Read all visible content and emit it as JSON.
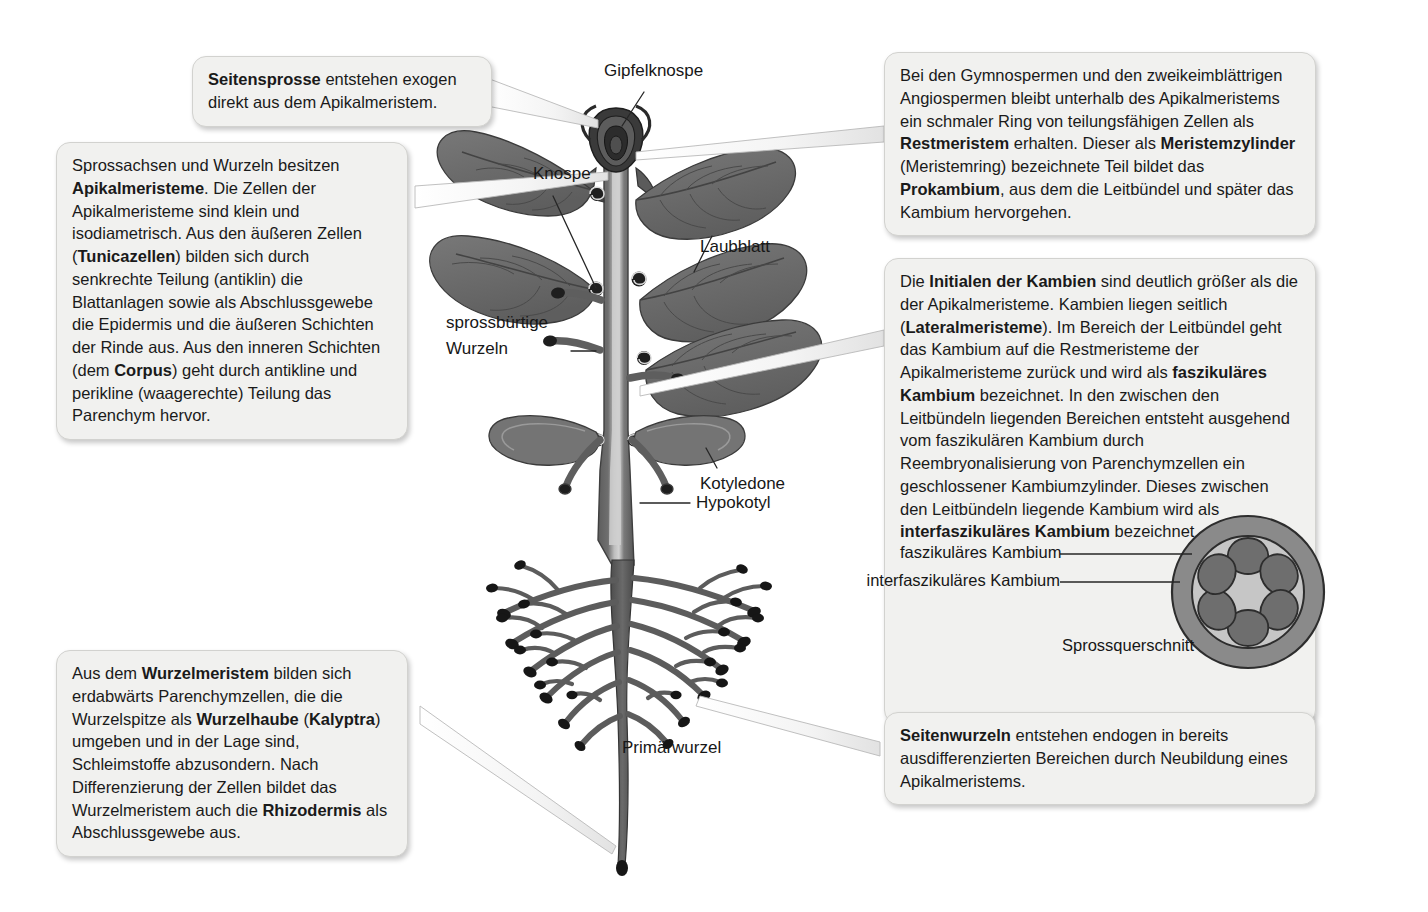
{
  "figure": {
    "background_color": "#ffffff"
  },
  "colors": {
    "callout_bg": "#f1f1ef",
    "callout_border": "#d2d2cf",
    "text": "#1a1a1a",
    "plant_mid_gray": "#6f6f6f",
    "plant_dark_gray": "#3a3a3a",
    "plant_light_gray": "#c9c9c9",
    "xsec_outer_ring": "#8a8a8a",
    "xsec_inner": "#c6c6c6",
    "xsec_bundle": "#6e6e6e",
    "leader_line": "#3a3a3a"
  },
  "callouts": [
    {
      "id": "seitensprosse",
      "name": "callout-seitensprosse",
      "segments": [
        {
          "text": "Seitensprosse",
          "bold": true
        },
        {
          "text": " entstehen exogen direkt aus dem Apikalmeristem.",
          "bold": false
        }
      ]
    },
    {
      "id": "apikalmeristeme",
      "name": "callout-apikalmeristeme",
      "segments": [
        {
          "text": "Sprossachsen und Wurzeln besitzen ",
          "bold": false
        },
        {
          "text": "Apikalmeristeme",
          "bold": true
        },
        {
          "text": ". Die Zellen der Apikalmeristeme sind klein und isodiametrisch. Aus den äußeren Zellen (",
          "bold": false
        },
        {
          "text": "Tunicazellen",
          "bold": true
        },
        {
          "text": ") bilden sich durch senkrechte Teilung (antiklin) die Blattanlagen sowie als Abschlussgewebe die Epidermis und die äußeren Schichten der Rinde aus. Aus den inneren Schichten (dem ",
          "bold": false
        },
        {
          "text": "Corpus",
          "bold": true
        },
        {
          "text": ") geht durch antikline und perikline (waagerechte) Teilung das Parenchym hervor.",
          "bold": false
        }
      ]
    },
    {
      "id": "gymnospermen",
      "name": "callout-gymnospermen-restmeristem",
      "segments": [
        {
          "text": "Bei den Gymnospermen und den zweikeimblättrigen Angiospermen bleibt unterhalb des Apikalmeristems ein schmaler Ring von teilungsfähigen Zellen als ",
          "bold": false
        },
        {
          "text": "Restmeristem",
          "bold": true
        },
        {
          "text": " erhalten. Dieser als ",
          "bold": false
        },
        {
          "text": "Meristemzylinder",
          "bold": true
        },
        {
          "text": " (Meristemring) bezeichnete Teil bildet das ",
          "bold": false
        },
        {
          "text": "Prokambium",
          "bold": true
        },
        {
          "text": ", aus dem die Leitbündel und später das Kambium hervorgehen.",
          "bold": false
        }
      ]
    },
    {
      "id": "kambien",
      "name": "callout-initialen-der-kambien",
      "segments": [
        {
          "text": "Die ",
          "bold": false
        },
        {
          "text": "Initialen der Kambien",
          "bold": true
        },
        {
          "text": " sind deutlich größer als die der Apikalmeristeme. Kambien liegen seitlich (",
          "bold": false
        },
        {
          "text": "Lateralmeristeme",
          "bold": true
        },
        {
          "text": "). Im Bereich der Leitbündel geht das Kambium auf die Restmeristeme der Apikalmeristeme zurück und wird als ",
          "bold": false
        },
        {
          "text": "faszikuläres Kambium",
          "bold": true
        },
        {
          "text": " bezeichnet. In den zwischen den Leitbündeln liegenden Bereichen entsteht ausgehend vom faszikulären Kambium durch Reembryonalisierung von Parenchymzellen ein geschlossener Kambiumzylinder. Dieses zwischen den Leitbündeln liegende Kambium wird als ",
          "bold": false
        },
        {
          "text": "interfaszikuläres Kambium",
          "bold": true
        },
        {
          "text": " bezeichnet.",
          "bold": false
        }
      ]
    },
    {
      "id": "wurzelmeristem",
      "name": "callout-wurzelmeristem",
      "segments": [
        {
          "text": "Aus dem ",
          "bold": false
        },
        {
          "text": "Wurzelmeristem",
          "bold": true
        },
        {
          "text": " bilden sich erdabwärts Parenchymzellen, die die Wurzelspitze als ",
          "bold": false
        },
        {
          "text": "Wurzelhaube",
          "bold": true
        },
        {
          "text": " (",
          "bold": false
        },
        {
          "text": "Kalyptra",
          "bold": true
        },
        {
          "text": ") umgeben und in der Lage sind, Schleimstoffe abzusondern. Nach Differenzierung der Zellen bildet das Wurzelmeristem auch die ",
          "bold": false
        },
        {
          "text": "Rhizodermis",
          "bold": true
        },
        {
          "text": " als Abschlussgewebe aus.",
          "bold": false
        }
      ]
    },
    {
      "id": "seitenwurzeln",
      "name": "callout-seitenwurzeln",
      "segments": [
        {
          "text": "Seitenwurzeln",
          "bold": true
        },
        {
          "text": " entstehen endogen in bereits ausdifferenzierten Bereichen durch Neubildung eines Apikalmeristems.",
          "bold": false
        }
      ]
    }
  ],
  "diagram_labels": [
    {
      "id": "gipfelknospe",
      "name": "label-gipfelknospe",
      "text": "Gipfelknospe"
    },
    {
      "id": "knospe",
      "name": "label-knospe",
      "text": "Knospe"
    },
    {
      "id": "laubblatt",
      "name": "label-laubblatt",
      "text": "Laubblatt"
    },
    {
      "id": "sprossbuertige",
      "name": "label-sprossbuertige-wurzeln-line1",
      "text": "sprossbürtige"
    },
    {
      "id": "wurzeln",
      "name": "label-sprossbuertige-wurzeln-line2",
      "text": "Wurzeln"
    },
    {
      "id": "kotyledone",
      "name": "label-kotyledone",
      "text": "Kotyledone"
    },
    {
      "id": "hypokotyl",
      "name": "label-hypokotyl",
      "text": "Hypokotyl"
    },
    {
      "id": "primaerwurzel",
      "name": "label-primaerwurzel",
      "text": "Primärwurzel"
    }
  ],
  "cross_section": {
    "name": "spross-cross-section",
    "caption": "Sprossquerschnitt",
    "labels": [
      {
        "id": "faszikulaeres",
        "name": "xsec-label-faszikulaeres-kambium",
        "text": "faszikuläres Kambium"
      },
      {
        "id": "interfaszikulaeres",
        "name": "xsec-label-interfaszikulaeres-kambium",
        "text": "interfaszikuläres Kambium"
      }
    ],
    "bundle_count": 6
  }
}
